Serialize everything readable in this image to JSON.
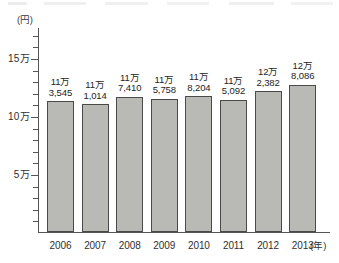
{
  "chart_data": {
    "type": "bar",
    "title": "",
    "xlabel": "(年)",
    "ylabel": "(円)",
    "unit_label": "(円)",
    "x_unit_label": "(年)",
    "categories": [
      "2006",
      "2007",
      "2008",
      "2009",
      "2010",
      "2011",
      "2012",
      "2013"
    ],
    "values": [
      113545,
      111014,
      117410,
      115758,
      118204,
      115092,
      122382,
      128086
    ],
    "value_labels": [
      {
        "line1": "11万",
        "line2": "3,545"
      },
      {
        "line1": "11万",
        "line2": "1,014"
      },
      {
        "line1": "11万",
        "line2": "7,410"
      },
      {
        "line1": "11万",
        "line2": "5,758"
      },
      {
        "line1": "11万",
        "line2": "8,204"
      },
      {
        "line1": "11万",
        "line2": "5,092"
      },
      {
        "line1": "12万",
        "line2": "2,382"
      },
      {
        "line1": "12万",
        "line2": "8,086"
      }
    ],
    "ylim": [
      0,
      160000
    ],
    "ytick_labels": [
      "15万",
      "10万",
      "5万"
    ],
    "ytick_values": [
      150000,
      100000,
      50000
    ],
    "yminor_step": 10000,
    "grid": false,
    "legend": null,
    "bar_color": "#b9b9b5",
    "bar_border_color": "#4a4a4a",
    "axis_color": "#555555"
  }
}
